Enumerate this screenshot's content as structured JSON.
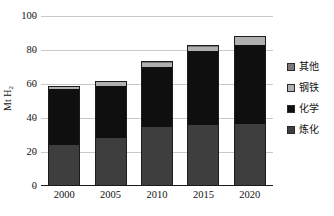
{
  "chart_data": {
    "type": "bar",
    "subtype": "stacked-bar",
    "title": "",
    "xlabel": "",
    "ylabel": "Mt H₂",
    "ylabel_plain": "Mt H2",
    "categories": [
      "2000",
      "2005",
      "2010",
      "2015",
      "2020"
    ],
    "ylim": [
      0,
      100
    ],
    "yticks": [
      "0",
      "20",
      "40",
      "60",
      "80",
      "100"
    ],
    "ytick_values": [
      0,
      20,
      40,
      60,
      80,
      100
    ],
    "grid": true,
    "grid_axis": "y",
    "legend_position": "right",
    "stack_order_bottom_to_top": [
      "炼化",
      "化学",
      "钢铁",
      "其他"
    ],
    "series": [
      {
        "name": "炼化",
        "name_en": "Refining",
        "color": "#3e3e3e",
        "values": [
          24.0,
          28.5,
          34.5,
          36.0,
          36.5
        ]
      },
      {
        "name": "化学",
        "name_en": "Chemical",
        "color": "#0f0f0f",
        "values": [
          33.0,
          30.5,
          35.5,
          43.5,
          46.5
        ]
      },
      {
        "name": "钢铁",
        "name_en": "Steel",
        "color": "#b0b0b0",
        "values": [
          1.0,
          2.0,
          2.5,
          2.5,
          4.5
        ]
      },
      {
        "name": "其他",
        "name_en": "Other",
        "color": "#7a7a7a",
        "values": [
          0.5,
          0.8,
          1.0,
          0.7,
          0.8
        ]
      }
    ],
    "totals": [
      58.5,
      61.8,
      73.5,
      82.7,
      88.3
    ]
  },
  "legend": {
    "items": [
      {
        "label": "其他",
        "color": "#7a7a7a"
      },
      {
        "label": "钢铁",
        "color": "#b0b0b0"
      },
      {
        "label": "化学",
        "color": "#0f0f0f"
      },
      {
        "label": "炼化",
        "color": "#3e3e3e"
      }
    ]
  },
  "axis": {
    "y_title_main": "Mt H",
    "y_title_sub": "2"
  }
}
